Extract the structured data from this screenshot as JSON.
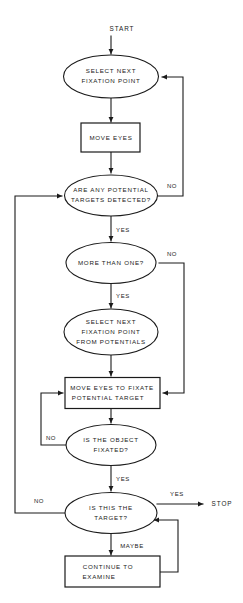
{
  "diagram": {
    "background_color": "#ffffff",
    "line_color": "#1a1a1a"
  },
  "terminals": {
    "start": "START",
    "stop": "STOP"
  },
  "nodes": {
    "select_next_fixation_point": {
      "shape": "ellipse",
      "lines": [
        "SELECT NEXT",
        "FIXATION POINT"
      ]
    },
    "move_eyes": {
      "shape": "rect",
      "lines": [
        "MOVE EYES"
      ]
    },
    "are_any_potential_targets_detected": {
      "shape": "ellipse",
      "lines": [
        "ARE ANY POTENTIAL",
        "TARGETS DETECTED?"
      ]
    },
    "more_than_one": {
      "shape": "ellipse",
      "lines": [
        "MORE THAN ONE?"
      ]
    },
    "select_next_fixation_point_from_potentials": {
      "shape": "ellipse",
      "lines": [
        "SELECT NEXT",
        "FIXATION POINT",
        "FROM POTENTIALS"
      ]
    },
    "move_eyes_to_fixate_potential_target": {
      "shape": "rect",
      "lines": [
        "MOVE EYES TO FIXATE",
        "POTENTIAL TARGET"
      ]
    },
    "is_the_object_fixated": {
      "shape": "ellipse",
      "lines": [
        "IS THE OBJECT",
        "FIXATED?"
      ]
    },
    "is_this_the_target": {
      "shape": "ellipse",
      "lines": [
        "IS THIS THE",
        "TARGET?"
      ]
    },
    "continue_to_examine": {
      "shape": "rect",
      "lines": [
        "CONTINUE TO",
        "EXAMINE"
      ]
    }
  },
  "edge_labels": {
    "detected_no": "NO",
    "detected_yes": "YES",
    "more_than_one_no": "NO",
    "more_than_one_yes": "YES",
    "fixated_no": "NO",
    "fixated_yes": "YES",
    "target_no": "NO",
    "target_yes": "YES",
    "target_maybe": "MAYBE"
  }
}
